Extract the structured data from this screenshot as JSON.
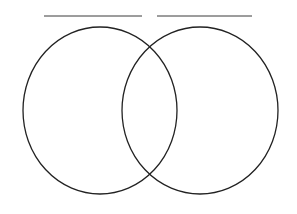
{
  "page": {
    "background_color": "#ffffff",
    "width": 297,
    "height": 214
  },
  "diagram": {
    "type": "venn-two-set",
    "stroke_color": "#222222",
    "stroke_width": 1.3,
    "fill": "none",
    "left_circle": {
      "name": "left-set-circle",
      "cx": 100,
      "cy": 110.5,
      "rx": 77,
      "ry": 83.5,
      "label": ""
    },
    "right_circle": {
      "name": "right-set-circle",
      "cx": 200,
      "cy": 110.5,
      "rx": 78,
      "ry": 83.5,
      "label": ""
    },
    "regions": [
      {
        "name": "left-only-region",
        "label": ""
      },
      {
        "name": "intersection-region",
        "label": ""
      },
      {
        "name": "right-only-region",
        "label": ""
      }
    ]
  },
  "label_lines": [
    {
      "name": "left-label-line",
      "value": "",
      "placeholder": "",
      "x1": 44,
      "x2": 142,
      "y": 16,
      "color": "#3a3a3a",
      "thickness": 1
    },
    {
      "name": "right-label-line",
      "value": "",
      "placeholder": "",
      "x1": 157,
      "x2": 252,
      "y": 16,
      "color": "#3a3a3a",
      "thickness": 1
    }
  ]
}
